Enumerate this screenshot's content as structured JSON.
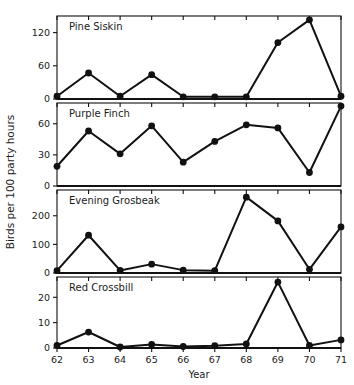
{
  "chart_data": {
    "type": "line",
    "title": "",
    "xlabel": "Year",
    "ylabel": "Birds per 100 party hours",
    "grid": false,
    "legend": "none",
    "x": [
      62,
      63,
      64,
      65,
      66,
      67,
      68,
      69,
      70,
      71
    ],
    "categories": [
      "62",
      "63",
      "64",
      "65",
      "66",
      "67",
      "68",
      "69",
      "70",
      "71"
    ],
    "panels": [
      {
        "name": "Pine Siskin",
        "ylim": [
          0,
          150
        ],
        "yticks": [
          0,
          60,
          120
        ],
        "ytick_labels": [
          "0",
          "60",
          "120"
        ],
        "values": [
          5,
          47,
          5,
          44,
          4,
          4,
          4,
          102,
          143,
          5,
          38
        ]
      },
      {
        "name": "Purple Finch",
        "ylim": [
          0,
          80
        ],
        "yticks": [
          0,
          30,
          60
        ],
        "ytick_labels": [
          "0",
          "30",
          "60"
        ],
        "values": [
          19,
          53,
          31,
          58,
          23,
          43,
          59,
          56,
          13,
          77
        ]
      },
      {
        "name": "Evening Grosbeak",
        "ylim": [
          0,
          290
        ],
        "yticks": [
          0,
          100,
          200
        ],
        "ytick_labels": [
          "0",
          "100",
          "200"
        ],
        "values": [
          8,
          132,
          9,
          31,
          10,
          8,
          265,
          182,
          13,
          161
        ]
      },
      {
        "name": "Red Crossbill",
        "ylim": [
          0,
          28
        ],
        "yticks": [
          0,
          10,
          20
        ],
        "ytick_labels": [
          "0",
          "10",
          "20"
        ],
        "values": [
          1,
          6.3,
          0.4,
          1.4,
          0.6,
          0.9,
          1.6,
          26,
          1,
          3.2
        ]
      }
    ]
  },
  "series_note": {
    "pine_siskin_points": 10,
    "purple_finch_points": 10,
    "evening_grosbeak_points": 10,
    "red_crossbill_points": 10
  }
}
